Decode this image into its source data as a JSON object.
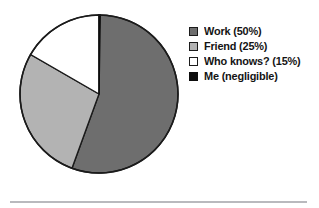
{
  "chart_data": {
    "type": "pie",
    "title": "",
    "xlabel": "",
    "ylabel": "",
    "legend_position": "right",
    "grid": false,
    "categories": [
      "Work",
      "Friend",
      "Who knows?",
      "Me"
    ],
    "values": [
      50,
      25,
      15,
      0
    ],
    "value_labels": [
      "50%",
      "25%",
      "15%",
      "negligible"
    ],
    "start_angle_deg": 0,
    "direction": "clockwise",
    "slices": [
      {
        "name": "Work",
        "legend_label": "Work (50%)",
        "value": 50,
        "value_label": "50%",
        "color": "#6e6e6e",
        "stroke": "#1b1b1b",
        "swatch_name": "legend-swatch-work"
      },
      {
        "name": "Friend",
        "legend_label": "Friend (25%)",
        "value": 25,
        "value_label": "25%",
        "color": "#b3b3b3",
        "stroke": "#1b1b1b",
        "swatch_name": "legend-swatch-friend"
      },
      {
        "name": "Who knows?",
        "legend_label": "Who knows? (15%)",
        "value": 15,
        "value_label": "15%",
        "color": "#ffffff",
        "stroke": "#1b1b1b",
        "swatch_name": "legend-swatch-who-knows"
      },
      {
        "name": "Me",
        "legend_label": "Me (negligible)",
        "value": 0,
        "value_label": "negligible",
        "color": "#0d0d0d",
        "stroke": "#0d0d0d",
        "swatch_name": "legend-swatch-me"
      }
    ]
  },
  "colors": {
    "background": "#ffffff",
    "outline": "#1b1b1b",
    "rule": "#b9b9bd",
    "text": "#141414"
  }
}
